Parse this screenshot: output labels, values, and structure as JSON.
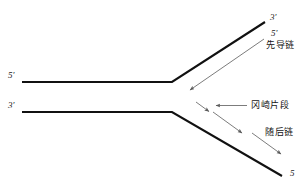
{
  "figure": {
    "background_color": "#ffffff",
    "strand_color": "#111111",
    "arrow_color": "#5a5a5a",
    "text_color": "#1a1a1a"
  },
  "labels": {
    "top_left_5prime": "5'",
    "bottom_left_3prime": "3'",
    "top_right_3prime": "3'",
    "top_right_5prime": "5'",
    "bottom_right_5": "5",
    "leading_strand": "先导链",
    "okazaki_fragment": "冈崎片段",
    "lagging_strand": "随后链"
  },
  "strands": [
    {
      "name": "parent-template-upper",
      "points": "22,82 172,82 265,22",
      "label_start": "5'",
      "label_end": "3'"
    },
    {
      "name": "parent-template-lower",
      "points": "22,112 172,112 282,176",
      "label_start": "3'",
      "label_end": "5"
    }
  ],
  "arrows": [
    {
      "name": "leading-strand-arrow",
      "x1": 264,
      "y1": 39,
      "x2": 189,
      "y2": 91,
      "direction": "down-left"
    },
    {
      "name": "okazaki-pointer-arrow",
      "x1": 247,
      "y1": 106,
      "x2": 214,
      "y2": 106,
      "direction": "left"
    },
    {
      "name": "okazaki-fragment-arrow-1",
      "x1": 197,
      "y1": 103,
      "x2": 210,
      "y2": 112,
      "direction": "down-right"
    },
    {
      "name": "okazaki-fragment-arrow-2",
      "x1": 213,
      "y1": 112,
      "x2": 243,
      "y2": 134,
      "direction": "down-right"
    },
    {
      "name": "okazaki-fragment-arrow-3",
      "x1": 252,
      "y1": 133,
      "x2": 282,
      "y2": 155,
      "direction": "down-right"
    }
  ]
}
